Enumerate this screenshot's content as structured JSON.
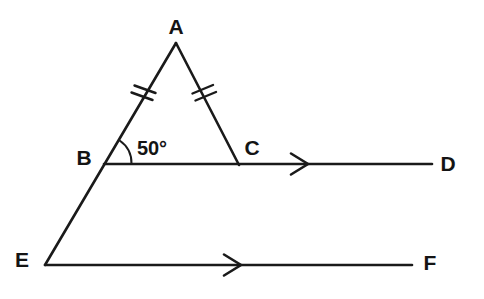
{
  "figure": {
    "type": "geometry-diagram",
    "background_color": "#ffffff",
    "stroke_color": "#1a1a1a"
  },
  "points": [
    {
      "id": "A",
      "label": "A",
      "x": 176,
      "y": 43,
      "label_x": 176,
      "label_y": 26
    },
    {
      "id": "B",
      "label": "B",
      "x": 104,
      "y": 164,
      "label_x": 84,
      "label_y": 157
    },
    {
      "id": "C",
      "label": "C",
      "x": 239,
      "y": 165,
      "label_x": 252,
      "label_y": 147
    },
    {
      "id": "D",
      "label": "D",
      "x": 432,
      "y": 164,
      "label_x": 448,
      "label_y": 163
    },
    {
      "id": "E",
      "label": "E",
      "x": 45,
      "y": 265,
      "label_x": 22,
      "label_y": 259
    },
    {
      "id": "F",
      "label": "F",
      "x": 412,
      "y": 265,
      "label_x": 430,
      "label_y": 262
    }
  ],
  "segments": [
    {
      "name": "segment-A-E",
      "from": "A",
      "to": "E",
      "path": "M176,43 L45,265"
    },
    {
      "name": "segment-A-C",
      "from": "A",
      "to": "C",
      "path": "M176,43 L239,165"
    },
    {
      "name": "segment-B-D",
      "from": "B",
      "to": "D",
      "path": "M104,164 L432,164"
    },
    {
      "name": "segment-E-F",
      "from": "E",
      "to": "F",
      "path": "M45,265 L412,265"
    }
  ],
  "tick_marks": {
    "count_per_side": 2,
    "meaning": "equal-length-sides",
    "sides": [
      "AB",
      "AC"
    ],
    "ab": {
      "cx": 145,
      "cy": 90
    },
    "ac": {
      "cx": 203,
      "cy": 90
    }
  },
  "angle": {
    "name": "angle-ABC",
    "vertex": "B",
    "value": "50°",
    "label_x": 152,
    "label_y": 148,
    "arc_radius": 28,
    "arc_path": "M124.7,143.1 A28,28 0 0 1 132,164"
  },
  "arrows": [
    {
      "name": "arrow-on-BD",
      "on": "BD",
      "x": 305,
      "y": 164,
      "direction": "right",
      "path": "M292,154 L308,164 L292,174"
    },
    {
      "name": "arrow-on-EF",
      "on": "EF",
      "x": 238,
      "y": 265,
      "direction": "right",
      "path": "M225,255 L241,265 L225,275"
    }
  ],
  "parallel_marks_note": "Single arrowheads on BD and EF denote the two lines are parallel"
}
